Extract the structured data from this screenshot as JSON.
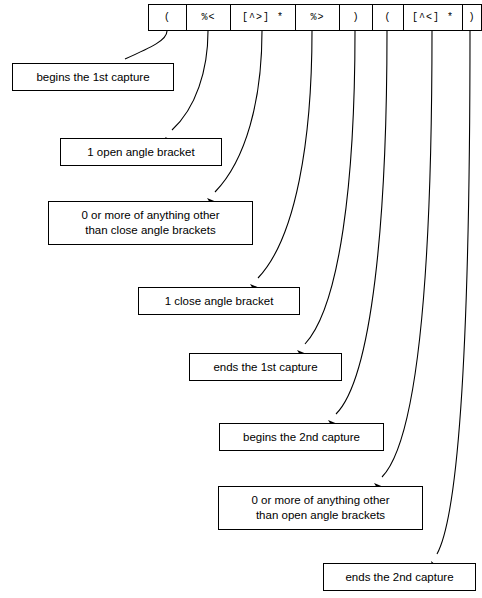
{
  "diagram": {
    "background_color": "#ffffff",
    "line_color": "#000000",
    "text_color": "#000000"
  },
  "regex": {
    "full_pattern": "(%<[^>]*%>)([^<]*)",
    "cells": [
      {
        "id": "cell-open-paren-1",
        "label": "(",
        "x": 148,
        "width": 38
      },
      {
        "id": "cell-percent-lt",
        "label": "%<",
        "x": 186,
        "width": 44
      },
      {
        "id": "cell-not-gt-star",
        "label": "[^>] *",
        "x": 230,
        "width": 65
      },
      {
        "id": "cell-percent-gt",
        "label": "%>",
        "x": 295,
        "width": 44
      },
      {
        "id": "cell-close-paren-1",
        "label": ")",
        "x": 339,
        "width": 33
      },
      {
        "id": "cell-open-paren-2",
        "label": "(",
        "x": 372,
        "width": 31
      },
      {
        "id": "cell-not-lt-star",
        "label": "[^<] *",
        "x": 403,
        "width": 59
      },
      {
        "id": "cell-close-paren-2",
        "label": ")",
        "x": 462,
        "width": 18
      }
    ]
  },
  "notes": [
    {
      "id": "note-begins-1st-capture",
      "line1": "begins the 1st capture",
      "line2": "",
      "x": 12,
      "y": 63,
      "width": 162,
      "height": 28
    },
    {
      "id": "note-1-open-angle-bracket",
      "line1": "1 open angle bracket",
      "line2": "",
      "x": 60,
      "y": 138,
      "width": 162,
      "height": 28
    },
    {
      "id": "note-0-or-more-not-close",
      "line1": "0 or more of anything other",
      "line2": "than close angle brackets",
      "x": 48,
      "y": 201,
      "width": 205,
      "height": 44
    },
    {
      "id": "note-1-close-angle-bracket",
      "line1": "1 close angle bracket",
      "line2": "",
      "x": 138,
      "y": 287,
      "width": 162,
      "height": 28
    },
    {
      "id": "note-ends-1st-capture",
      "line1": "ends the 1st capture",
      "line2": "",
      "x": 189,
      "y": 353,
      "width": 153,
      "height": 28
    },
    {
      "id": "note-begins-2nd-capture",
      "line1": "begins the 2nd capture",
      "line2": "",
      "x": 219,
      "y": 423,
      "width": 165,
      "height": 28
    },
    {
      "id": "note-0-or-more-not-open",
      "line1": "0 or more of anything other",
      "line2": "than open angle brackets",
      "x": 218,
      "y": 486,
      "width": 205,
      "height": 44
    },
    {
      "id": "note-ends-2nd-capture",
      "line1": "ends the 2nd capture",
      "line2": "",
      "x": 323,
      "y": 563,
      "width": 153,
      "height": 28
    }
  ],
  "connectors": [
    {
      "id": "connector-1",
      "from_cell": "cell-open-paren-1",
      "to_note": "note-begins-1st-capture",
      "path": "M 167 31 C 167 40, 152 47, 125 59",
      "tip": "118,64",
      "angle": 205
    },
    {
      "id": "connector-2",
      "from_cell": "cell-percent-lt",
      "to_note": "note-1-open-angle-bracket",
      "path": "M 208 31 C 208 70, 196 108, 172 130",
      "tip": "165,137",
      "angle": 223
    },
    {
      "id": "connector-3",
      "from_cell": "cell-not-gt-star",
      "to_note": "note-0-or-more-not-close",
      "path": "M 262 31 C 262 100, 246 160, 215 192",
      "tip": "207,198",
      "angle": 222
    },
    {
      "id": "connector-4",
      "from_cell": "cell-percent-gt",
      "to_note": "note-1-close-angle-bracket",
      "path": "M 312 31 C 312 140, 296 238, 258 278",
      "tip": "250,284",
      "angle": 222
    },
    {
      "id": "connector-5",
      "from_cell": "cell-close-paren-1",
      "to_note": "note-ends-1st-capture",
      "path": "M 355 31 C 355 180, 340 306, 305 344",
      "tip": "297,350",
      "angle": 222
    },
    {
      "id": "connector-6",
      "from_cell": "cell-open-paren-2",
      "to_note": "note-begins-2nd-capture",
      "path": "M 387 31 C 387 220, 372 378, 336 414",
      "tip": "328,420",
      "angle": 222
    },
    {
      "id": "connector-7",
      "from_cell": "cell-not-lt-star",
      "to_note": "note-0-or-more-not-open",
      "path": "M 432 31 C 432 270, 418 440, 382 477",
      "tip": "374,483",
      "angle": 222
    },
    {
      "id": "connector-8",
      "from_cell": "cell-close-paren-2",
      "to_note": "note-ends-2nd-capture",
      "path": "M 470 31 C 470 320, 460 512, 437 554",
      "tip": "431,561",
      "angle": 240
    }
  ]
}
